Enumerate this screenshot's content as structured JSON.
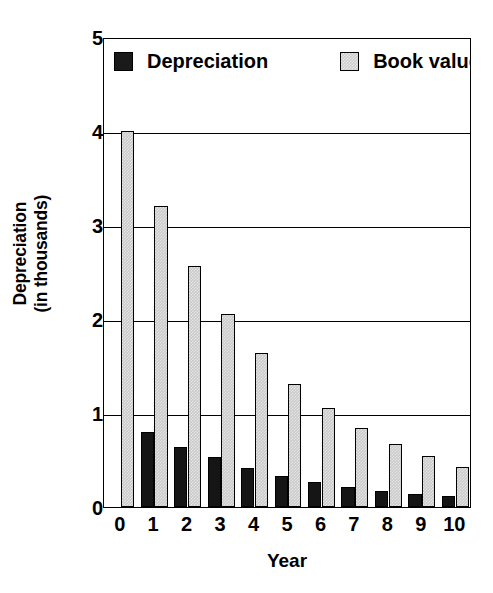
{
  "chart_data": {
    "type": "bar",
    "title": "",
    "xlabel": "Year",
    "ylabel": "Depreciation (in thousands)",
    "ylabel_line1": "Depreciation",
    "ylabel_line2": "(in thousands)",
    "categories": [
      "0",
      "1",
      "2",
      "3",
      "4",
      "5",
      "6",
      "7",
      "8",
      "9",
      "10"
    ],
    "series": [
      {
        "name": "Depreciation",
        "color": "#151515",
        "values": [
          0,
          0.8,
          0.64,
          0.53,
          0.41,
          0.33,
          0.27,
          0.21,
          0.17,
          0.14,
          0.12
        ]
      },
      {
        "name": "Book value",
        "color": "#c9c9c9",
        "values": [
          4.0,
          3.2,
          2.56,
          2.05,
          1.64,
          1.31,
          1.05,
          0.84,
          0.67,
          0.54,
          0.43
        ]
      }
    ],
    "ylim": [
      0,
      5
    ],
    "yticks": [
      0,
      1,
      2,
      3,
      4,
      5
    ],
    "ytick_labels": [
      "0",
      "1",
      "2",
      "3",
      "4",
      "5"
    ],
    "grid": "horizontal",
    "legend_position": "top-inside"
  },
  "legend": {
    "entries": [
      {
        "label": "Depreciation",
        "swatch": "black-square"
      },
      {
        "label": "Book value",
        "swatch": "gray-square"
      }
    ]
  }
}
